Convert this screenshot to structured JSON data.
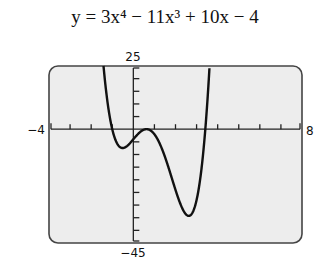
{
  "title": "y = 3x⁴ − 11x³ + 10x − 4",
  "chart_data": {
    "type": "line",
    "function": {
      "coefficients": {
        "x4": 3,
        "x3": -11,
        "x2": 0,
        "x1": 10,
        "x0": -4
      }
    },
    "xlim": [
      -4,
      8
    ],
    "ylim": [
      -45,
      25
    ],
    "xscale_tick": 1,
    "yscale_tick": 5,
    "tick_labels": {
      "xmin": "−4",
      "xmax": "8",
      "ymax": "25",
      "ymin": "−45"
    },
    "grid": false,
    "key_points": [
      {
        "x": -0.6,
        "y": -8.8,
        "label": "local min"
      },
      {
        "x": 0.5,
        "y": -0.2,
        "label": "local max"
      },
      {
        "x": 2.6,
        "y": -34.6,
        "label": "local min"
      }
    ],
    "colors": {
      "frame_fill": "#ededed",
      "frame_stroke": "#444444",
      "curve": "#111111"
    }
  }
}
